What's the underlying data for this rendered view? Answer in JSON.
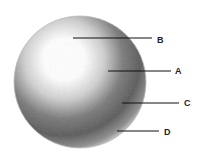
{
  "diagram": {
    "type": "shaded-sphere",
    "sphere": {
      "cx": 80,
      "cy": 82,
      "r": 66
    },
    "callouts": [
      {
        "label": "B",
        "x1": 73,
        "y1": 38,
        "x2": 152,
        "y2": 38,
        "lx": 157,
        "ly": 36
      },
      {
        "label": "A",
        "x1": 108,
        "y1": 71,
        "x2": 171,
        "y2": 71,
        "lx": 175,
        "ly": 67
      },
      {
        "label": "C",
        "x1": 122,
        "y1": 103,
        "x2": 179,
        "y2": 103,
        "lx": 184,
        "ly": 99
      },
      {
        "label": "D",
        "x1": 117,
        "y1": 131,
        "x2": 159,
        "y2": 131,
        "lx": 164,
        "ly": 128
      }
    ]
  }
}
